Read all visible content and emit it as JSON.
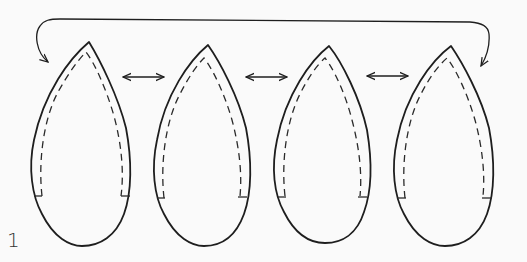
{
  "figure": {
    "step_number": "1",
    "panels": [
      {
        "index": 1,
        "tip": [
          89,
          42
        ],
        "left": 30,
        "right": 130,
        "bottom": 246
      },
      {
        "index": 2,
        "tip": [
          208,
          45
        ],
        "left": 153,
        "right": 251,
        "bottom": 246
      },
      {
        "index": 3,
        "tip": [
          329,
          46
        ],
        "left": 273,
        "right": 371,
        "bottom": 243
      },
      {
        "index": 4,
        "tip": [
          451,
          46
        ],
        "left": 393,
        "right": 494,
        "bottom": 246
      }
    ],
    "connectors": [
      {
        "type": "double-arrow",
        "from_panel": 1,
        "to_panel": 2
      },
      {
        "type": "double-arrow",
        "from_panel": 2,
        "to_panel": 3
      },
      {
        "type": "double-arrow",
        "from_panel": 3,
        "to_panel": 4
      },
      {
        "type": "curved-arrow",
        "from_panel": 4,
        "to_panel": 1,
        "bidirectional": true
      }
    ],
    "colors": {
      "background": "#fafafa",
      "stroke": "#1e1e1e"
    }
  }
}
